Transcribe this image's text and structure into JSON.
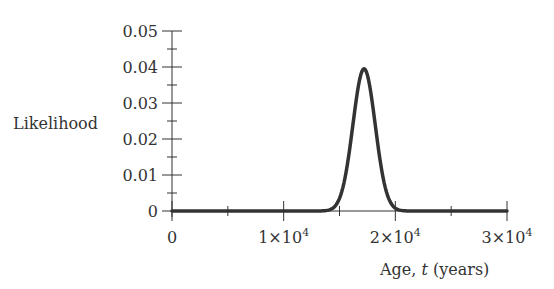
{
  "chart_data": {
    "type": "line",
    "title": "",
    "xlabel": "Age, t (years)",
    "xlabel_parts": {
      "prefix": "Age, ",
      "var": "t",
      "suffix": " (years)"
    },
    "ylabel": "Likelihood",
    "xlim": [
      0,
      30000
    ],
    "ylim": [
      0,
      0.05
    ],
    "grid": false,
    "legend": null,
    "x_ticks": [
      0,
      10000,
      20000,
      30000
    ],
    "x_tick_labels": [
      {
        "base": "0",
        "exp": ""
      },
      {
        "base": "1×10",
        "exp": "4"
      },
      {
        "base": "2×10",
        "exp": "4"
      },
      {
        "base": "3×10",
        "exp": "4"
      }
    ],
    "x_minor_ticks": [
      5000,
      15000,
      25000
    ],
    "y_ticks": [
      0,
      0.01,
      0.02,
      0.03,
      0.04,
      0.05
    ],
    "y_tick_labels": [
      "0",
      "0.01",
      "0.02",
      "0.03",
      "0.04",
      "0.05"
    ],
    "y_minor_ticks": [
      0.005,
      0.015,
      0.025,
      0.035,
      0.045
    ],
    "series": [
      {
        "name": "Likelihood",
        "shape": "gaussian",
        "peak_x": 17200,
        "peak_y": 0.0395,
        "sigma": 1000,
        "x": [
          0,
          5000,
          10000,
          14000,
          15000,
          15500,
          16000,
          16500,
          17000,
          17200,
          17500,
          18000,
          18500,
          19000,
          19500,
          20000,
          25000,
          30000
        ],
        "values": [
          0,
          0,
          0,
          0.0002,
          0.0035,
          0.0092,
          0.0192,
          0.0309,
          0.0387,
          0.0395,
          0.0377,
          0.0288,
          0.0174,
          0.0083,
          0.0028,
          0.0008,
          0,
          0
        ]
      }
    ]
  }
}
